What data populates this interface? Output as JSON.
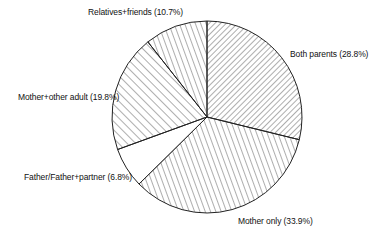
{
  "chart_data": {
    "type": "pie",
    "title": "",
    "slices": [
      {
        "label": "Both parents",
        "value": 28.8,
        "display": "Both parents (28.8%)",
        "pattern": "diag-dense"
      },
      {
        "label": "Mother only",
        "value": 33.9,
        "display": "Mother only (33.9%)",
        "pattern": "diag-steep"
      },
      {
        "label": "Father/Father+partner",
        "value": 6.8,
        "display": "Father/Father+partner (6.8%)",
        "pattern": "blank"
      },
      {
        "label": "Mother+other adult",
        "value": 19.8,
        "display": "Mother+other adult (19.8%)",
        "pattern": "diag-back"
      },
      {
        "label": "Relatives+friends",
        "value": 10.7,
        "display": "Relatives+friends (10.7%)",
        "pattern": "diag-steep-back"
      }
    ],
    "start_angle": "12 o'clock, clockwise",
    "colors": {
      "line": "#222222",
      "fill": "#ffffff"
    }
  }
}
